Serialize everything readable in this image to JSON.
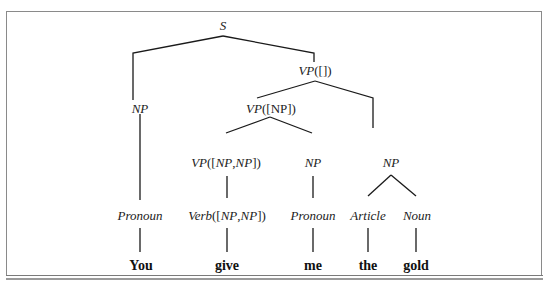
{
  "diagram": {
    "type": "parse-tree",
    "nodes": {
      "s": "S",
      "vp_empty": {
        "head": "VP",
        "arg": "([])"
      },
      "np_subject": "NP",
      "vp_np": {
        "head": "VP",
        "arg_open": "([",
        "arg": "NP",
        "arg_close": "])"
      },
      "vp_np_np": {
        "head": "VP",
        "open": "([",
        "a": "NP",
        "sep": ",",
        "b": "NP",
        "close": "])"
      },
      "np_indirect": "NP",
      "np_direct": "NP",
      "pronoun_1": "Pronoun",
      "verb": {
        "head": "Verb",
        "open": "([",
        "a": "NP",
        "sep": ",",
        "b": "NP",
        "close": "])"
      },
      "pronoun_2": "Pronoun",
      "article": "Article",
      "noun": "Noun"
    },
    "words": [
      "You",
      "give",
      "me",
      "the",
      "gold"
    ]
  }
}
